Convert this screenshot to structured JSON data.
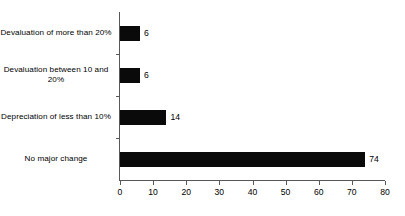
{
  "chart_data": {
    "type": "bar",
    "orientation": "horizontal",
    "title": "",
    "subtitle": "",
    "xlabel": "",
    "ylabel": "",
    "categories": [
      "Devaluation of more than 20%",
      "Devaluation between 10 and 20%",
      "Depreciation of less than 10%",
      "No major change"
    ],
    "values": [
      6,
      6,
      14,
      74
    ],
    "value_labels": [
      "6",
      "6",
      "14",
      "74"
    ],
    "xlim": [
      0,
      80
    ],
    "xticks": [
      0,
      10,
      20,
      30,
      40,
      50,
      60,
      70,
      80
    ],
    "xtick_labels": [
      "0",
      "10",
      "20",
      "30",
      "40",
      "50",
      "60",
      "70",
      "80"
    ],
    "grid": false,
    "legend": false,
    "bar_color": "#0a0a0a",
    "axis_color": "#585858",
    "background_color": "#ffffff"
  }
}
